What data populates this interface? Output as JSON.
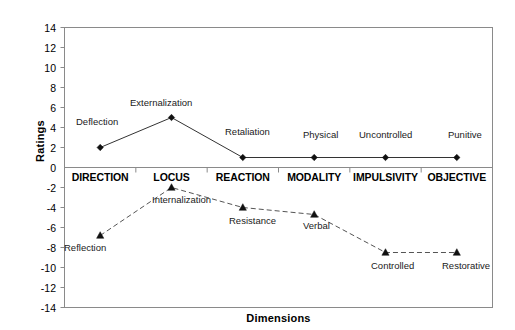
{
  "chart_data": {
    "type": "line",
    "title": "",
    "xlabel": "Dimensions",
    "ylabel": "Ratings",
    "ylim": [
      -14,
      14
    ],
    "ytick_labels": [
      "14",
      "12",
      "10",
      "8",
      "6",
      "4",
      "2",
      "0",
      "-2",
      "-4",
      "-6",
      "-8",
      "-10",
      "-12",
      "-14"
    ],
    "ytick_values": [
      14,
      12,
      10,
      8,
      6,
      4,
      2,
      0,
      -2,
      -4,
      -6,
      -8,
      -10,
      -12,
      -14
    ],
    "grid": false,
    "legend": "none",
    "categories": [
      "DIRECTION",
      "LOCUS",
      "REACTION",
      "MODALITY",
      "IMPULSIVITY",
      "OBJECTIVE"
    ],
    "series": [
      {
        "name": "upper",
        "line_style": "solid",
        "marker": "diamond",
        "color": "#333333",
        "values": [
          2,
          5,
          1,
          1,
          1,
          1
        ],
        "point_labels": [
          "Deflection",
          "Externalization",
          "Retaliation",
          "Physical",
          "Uncontrolled",
          "Punitive"
        ]
      },
      {
        "name": "lower",
        "line_style": "dashed",
        "marker": "triangle",
        "color": "#555555",
        "values": [
          -6.8,
          -2.0,
          -4.0,
          -4.7,
          -8.5,
          -8.5
        ],
        "point_labels": [
          "Reflection",
          "Internalization",
          "Resistance",
          "Verbal",
          "Controlled",
          "Restorative"
        ]
      }
    ]
  },
  "annotations": {
    "upper": [
      {
        "text": "Deflection",
        "x": 76,
        "y": 117
      },
      {
        "text": "Externalization",
        "x": 130,
        "y": 98
      },
      {
        "text": "Retaliation",
        "x": 225,
        "y": 127
      },
      {
        "text": "Physical",
        "x": 303,
        "y": 130
      },
      {
        "text": "Uncontrolled",
        "x": 359,
        "y": 130
      },
      {
        "text": "Punitive",
        "x": 448,
        "y": 130
      }
    ],
    "lower": [
      {
        "text": "Reflection",
        "x": 64,
        "y": 243
      },
      {
        "text": "Internalization",
        "x": 152,
        "y": 195
      },
      {
        "text": "Resistance",
        "x": 229,
        "y": 216
      },
      {
        "text": "Verbal",
        "x": 303,
        "y": 221
      },
      {
        "text": "Controlled",
        "x": 371,
        "y": 261
      },
      {
        "text": "Restorative",
        "x": 442,
        "y": 261
      }
    ]
  }
}
